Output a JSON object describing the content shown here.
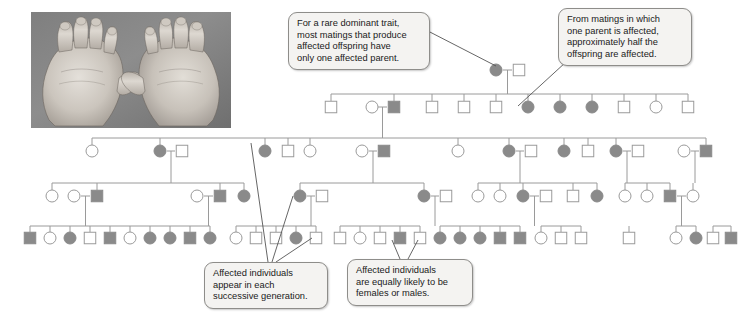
{
  "figure": {
    "photo": {
      "name": "hands-photo",
      "alt": "Photograph of two hands showing shortened digits (brachydactyly)"
    }
  },
  "colors": {
    "affected_fill": "#8a8a8a",
    "unaffected_fill": "#ffffff",
    "symbol_stroke": "#9a9a9a",
    "line": "#9a9a9a",
    "callout_bg": "#f4f3f1",
    "callout_border": "#8e8d8a",
    "text": "#1a1a1a",
    "leader_line": "#555555"
  },
  "callouts": [
    {
      "id": "callout-rare-dominant",
      "name": "callout-rare-dominant-trait",
      "lines": [
        "For a rare dominant trait,",
        "most matings that produce",
        "affected offspring have",
        "only one affected parent."
      ],
      "x": 288,
      "y": 12,
      "width": 142,
      "height": 54,
      "leader": {
        "x1": 426,
        "y1": 30,
        "x2": 496,
        "y2": 66
      }
    },
    {
      "id": "callout-half-offspring",
      "name": "callout-half-offspring-affected",
      "lines": [
        "From matings in which",
        "one parent is affected,",
        "approximately half the",
        "offspring are affected."
      ],
      "x": 558,
      "y": 8,
      "width": 134,
      "height": 54,
      "leader": {
        "x1": 566,
        "y1": 62,
        "x2": 518,
        "y2": 106
      }
    },
    {
      "id": "callout-successive-generation",
      "name": "callout-successive-generations",
      "lines": [
        "Affected individuals",
        "appear in each",
        "successive generation."
      ],
      "x": 204,
      "y": 262,
      "width": 124,
      "height": 44,
      "leader_multi": [
        {
          "x1": 268,
          "y1": 262,
          "x2": 251,
          "y2": 143
        },
        {
          "x1": 272,
          "y1": 262,
          "x2": 293,
          "y2": 196
        },
        {
          "x1": 276,
          "y1": 262,
          "x2": 312,
          "y2": 238
        }
      ]
    },
    {
      "id": "callout-equally-likely",
      "name": "callout-equally-likely-sex",
      "lines": [
        "Affected individuals",
        "are equally likely to be",
        "females or males."
      ],
      "x": 347,
      "y": 259,
      "width": 126,
      "height": 44,
      "leader_multi": [
        {
          "x1": 400,
          "y1": 259,
          "x2": 392,
          "y2": 240
        },
        {
          "x1": 408,
          "y1": 259,
          "x2": 418,
          "y2": 240
        }
      ]
    }
  ],
  "legend": {
    "affected_label": "affected",
    "unaffected_label": "unaffected",
    "female_shape": "circle",
    "male_shape": "square"
  },
  "pedigree": {
    "generations": [
      {
        "label": "I",
        "y": 70,
        "individuals": [
          {
            "name": "gen1-female-affected",
            "shape": "circle",
            "affected": true,
            "x": 496
          },
          {
            "name": "gen1-male-unaffected",
            "shape": "square",
            "affected": false,
            "x": 519
          }
        ]
      },
      {
        "label": "II",
        "y": 107,
        "individuals": [
          {
            "name": "gen2-male-unaffected-1",
            "shape": "square",
            "affected": false,
            "x": 331
          },
          {
            "name": "gen2-female-spouse-1",
            "shape": "circle",
            "affected": false,
            "x": 372
          },
          {
            "name": "gen2-male-affected-1",
            "shape": "square",
            "affected": true,
            "x": 394
          },
          {
            "name": "gen2-male-unaffected-2",
            "shape": "square",
            "affected": false,
            "x": 432
          },
          {
            "name": "gen2-male-unaffected-3",
            "shape": "square",
            "affected": false,
            "x": 464
          },
          {
            "name": "gen2-male-unaffected-4",
            "shape": "square",
            "affected": false,
            "x": 496
          },
          {
            "name": "gen2-female-affected-1",
            "shape": "circle",
            "affected": true,
            "x": 528
          },
          {
            "name": "gen2-female-affected-2",
            "shape": "circle",
            "affected": true,
            "x": 560
          },
          {
            "name": "gen2-female-affected-3",
            "shape": "circle",
            "affected": true,
            "x": 592
          },
          {
            "name": "gen2-male-unaffected-5",
            "shape": "square",
            "affected": false,
            "x": 624
          },
          {
            "name": "gen2-female-unaffected-2",
            "shape": "circle",
            "affected": false,
            "x": 656
          },
          {
            "name": "gen2-male-unaffected-6",
            "shape": "square",
            "affected": false,
            "x": 688
          }
        ]
      },
      {
        "label": "III",
        "y": 151,
        "individuals": [
          {
            "name": "gen3-female-unaffected-1",
            "shape": "circle",
            "affected": false,
            "x": 92
          },
          {
            "name": "gen3-female-affected-1",
            "shape": "circle",
            "affected": true,
            "x": 160
          },
          {
            "name": "gen3-male-spouse-1",
            "shape": "square",
            "affected": false,
            "x": 182
          },
          {
            "name": "gen3-female-affected-2",
            "shape": "circle",
            "affected": true,
            "x": 265
          },
          {
            "name": "gen3-male-unaffected-1",
            "shape": "square",
            "affected": false,
            "x": 288
          },
          {
            "name": "gen3-female-unaffected-2",
            "shape": "circle",
            "affected": false,
            "x": 310
          },
          {
            "name": "gen3-female-spouse-2",
            "shape": "circle",
            "affected": false,
            "x": 362
          },
          {
            "name": "gen3-male-affected-1",
            "shape": "square",
            "affected": true,
            "x": 384
          },
          {
            "name": "gen3-female-unaffected-3",
            "shape": "circle",
            "affected": false,
            "x": 458
          },
          {
            "name": "gen3-female-affected-3",
            "shape": "circle",
            "affected": true,
            "x": 509
          },
          {
            "name": "gen3-male-spouse-2",
            "shape": "square",
            "affected": false,
            "x": 531
          },
          {
            "name": "gen3-female-affected-4",
            "shape": "circle",
            "affected": true,
            "x": 564
          },
          {
            "name": "gen3-male-unaffected-2",
            "shape": "square",
            "affected": false,
            "x": 588
          },
          {
            "name": "gen3-female-affected-5",
            "shape": "circle",
            "affected": true,
            "x": 616
          },
          {
            "name": "gen3-male-spouse-3",
            "shape": "square",
            "affected": false,
            "x": 638
          },
          {
            "name": "gen3-female-spouse-3",
            "shape": "circle",
            "affected": false,
            "x": 684
          },
          {
            "name": "gen3-male-affected-2",
            "shape": "square",
            "affected": true,
            "x": 706
          }
        ]
      },
      {
        "label": "IV",
        "y": 196,
        "individuals": [
          {
            "name": "gen4-female-unaffected-1",
            "shape": "circle",
            "affected": false,
            "x": 52
          },
          {
            "name": "gen4-female-spouse-1",
            "shape": "circle",
            "affected": false,
            "x": 74
          },
          {
            "name": "gen4-male-affected-1",
            "shape": "square",
            "affected": true,
            "x": 97
          },
          {
            "name": "gen4-female-spouse-2",
            "shape": "circle",
            "affected": false,
            "x": 197
          },
          {
            "name": "gen4-male-affected-2",
            "shape": "square",
            "affected": true,
            "x": 220
          },
          {
            "name": "gen4-female-affected-1",
            "shape": "circle",
            "affected": true,
            "x": 244
          },
          {
            "name": "gen4-female-affected-2",
            "shape": "circle",
            "affected": true,
            "x": 300
          },
          {
            "name": "gen4-male-spouse-1",
            "shape": "square",
            "affected": false,
            "x": 322
          },
          {
            "name": "gen4-female-affected-3",
            "shape": "circle",
            "affected": true,
            "x": 424
          },
          {
            "name": "gen4-male-spouse-2",
            "shape": "square",
            "affected": false,
            "x": 446
          },
          {
            "name": "gen4-female-unaffected-2",
            "shape": "circle",
            "affected": false,
            "x": 478
          },
          {
            "name": "gen4-female-unaffected-3",
            "shape": "circle",
            "affected": false,
            "x": 500
          },
          {
            "name": "gen4-female-affected-4",
            "shape": "circle",
            "affected": true,
            "x": 523
          },
          {
            "name": "gen4-male-spouse-3",
            "shape": "square",
            "affected": false,
            "x": 546
          },
          {
            "name": "gen4-male-unaffected-1",
            "shape": "square",
            "affected": false,
            "x": 573
          },
          {
            "name": "gen4-female-affected-5",
            "shape": "circle",
            "affected": true,
            "x": 597
          },
          {
            "name": "gen4-female-unaffected-4",
            "shape": "circle",
            "affected": false,
            "x": 625
          },
          {
            "name": "gen4-female-unaffected-5",
            "shape": "circle",
            "affected": false,
            "x": 647
          },
          {
            "name": "gen4-male-affected-3",
            "shape": "square",
            "affected": true,
            "x": 670
          },
          {
            "name": "gen4-female-unaffected-6",
            "shape": "circle",
            "affected": false,
            "x": 693
          }
        ]
      },
      {
        "label": "V",
        "y": 238,
        "individuals": [
          {
            "name": "gen5-male-affected-1",
            "shape": "square",
            "affected": true,
            "x": 30
          },
          {
            "name": "gen5-female-unaffected-1",
            "shape": "circle",
            "affected": false,
            "x": 50
          },
          {
            "name": "gen5-female-affected-1",
            "shape": "circle",
            "affected": true,
            "x": 70
          },
          {
            "name": "gen5-male-unaffected-1",
            "shape": "square",
            "affected": false,
            "x": 90
          },
          {
            "name": "gen5-male-affected-2",
            "shape": "square",
            "affected": true,
            "x": 110
          },
          {
            "name": "gen5-female-unaffected-2",
            "shape": "circle",
            "affected": false,
            "x": 130
          },
          {
            "name": "gen5-female-affected-2",
            "shape": "circle",
            "affected": true,
            "x": 150
          },
          {
            "name": "gen5-female-affected-3",
            "shape": "circle",
            "affected": true,
            "x": 170
          },
          {
            "name": "gen5-male-affected-3",
            "shape": "square",
            "affected": true,
            "x": 190
          },
          {
            "name": "gen5-female-affected-4",
            "shape": "circle",
            "affected": true,
            "x": 210
          },
          {
            "name": "gen5-female-unaffected-3",
            "shape": "circle",
            "affected": false,
            "x": 236
          },
          {
            "name": "gen5-male-unaffected-2",
            "shape": "square",
            "affected": false,
            "x": 256
          },
          {
            "name": "gen5-male-unaffected-3",
            "shape": "square",
            "affected": false,
            "x": 276
          },
          {
            "name": "gen5-female-affected-5",
            "shape": "circle",
            "affected": true,
            "x": 296
          },
          {
            "name": "gen5-male-unaffected-4",
            "shape": "square",
            "affected": false,
            "x": 316
          },
          {
            "name": "gen5-male-unaffected-5",
            "shape": "square",
            "affected": false,
            "x": 340
          },
          {
            "name": "gen5-female-unaffected-4",
            "shape": "circle",
            "affected": false,
            "x": 360
          },
          {
            "name": "gen5-male-unaffected-6",
            "shape": "square",
            "affected": false,
            "x": 380
          },
          {
            "name": "gen5-male-affected-4",
            "shape": "square",
            "affected": true,
            "x": 400
          },
          {
            "name": "gen5-male-unaffected-7",
            "shape": "square",
            "affected": false,
            "x": 420
          },
          {
            "name": "gen5-female-affected-6",
            "shape": "circle",
            "affected": true,
            "x": 440
          },
          {
            "name": "gen5-female-affected-7",
            "shape": "circle",
            "affected": true,
            "x": 460
          },
          {
            "name": "gen5-female-affected-8",
            "shape": "circle",
            "affected": true,
            "x": 480
          },
          {
            "name": "gen5-male-affected-5",
            "shape": "square",
            "affected": true,
            "x": 500
          },
          {
            "name": "gen5-male-affected-6",
            "shape": "square",
            "affected": true,
            "x": 520
          },
          {
            "name": "gen5-female-unaffected-5",
            "shape": "circle",
            "affected": false,
            "x": 541
          },
          {
            "name": "gen5-male-unaffected-8",
            "shape": "square",
            "affected": false,
            "x": 561
          },
          {
            "name": "gen5-male-unaffected-9",
            "shape": "square",
            "affected": false,
            "x": 581
          },
          {
            "name": "gen5-male-unaffected-10",
            "shape": "square",
            "affected": false,
            "x": 629
          },
          {
            "name": "gen5-female-unaffected-6",
            "shape": "circle",
            "affected": false,
            "x": 676
          },
          {
            "name": "gen5-female-affected-9",
            "shape": "circle",
            "affected": true,
            "x": 696
          },
          {
            "name": "gen5-male-unaffected-11",
            "shape": "square",
            "affected": false,
            "x": 713
          },
          {
            "name": "gen5-male-affected-7",
            "shape": "square",
            "affected": true,
            "x": 731
          }
        ]
      }
    ],
    "counts": {
      "generation_1": 2,
      "generation_2": 12,
      "generation_3": 17,
      "generation_4": 20,
      "generation_5": 33
    }
  }
}
